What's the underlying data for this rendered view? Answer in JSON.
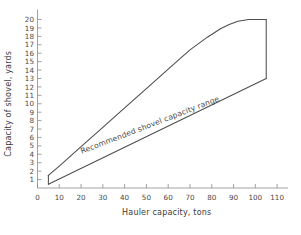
{
  "chart_data": {
    "type": "line",
    "title": "",
    "xlabel": "Hauler capacity, tons",
    "ylabel": "Capacity of shovel, yards",
    "xlim": [
      0,
      115
    ],
    "ylim": [
      0,
      21
    ],
    "grid": false,
    "legend": null,
    "xticks": [
      0,
      10,
      20,
      30,
      40,
      50,
      60,
      70,
      80,
      90,
      100,
      110
    ],
    "xticklabels": [
      "0",
      "10",
      "20",
      "30",
      "40",
      "50",
      "60",
      "70",
      "80",
      "90",
      "100",
      "110"
    ],
    "yticks": [
      1,
      2,
      3,
      4,
      5,
      6,
      7,
      8,
      9,
      10,
      11,
      12,
      13,
      14,
      15,
      16,
      17,
      18,
      19,
      20
    ],
    "yticklabels": [
      "1",
      "2",
      "3",
      "4",
      "5",
      "6",
      "7",
      "8",
      "9",
      "10",
      "11",
      "12",
      "13",
      "14",
      "15",
      "16",
      "17",
      "18",
      "19",
      "20"
    ],
    "annotations": [
      {
        "text": "Recommended shovel capacity range",
        "x": 52,
        "y": 7.2,
        "rotation": -21
      }
    ],
    "series": [
      {
        "name": "upper-bound",
        "comment": "upper boundary of recommended shovel capacity envelope",
        "x": [
          5,
          10,
          20,
          30,
          40,
          50,
          60,
          70,
          78,
          84,
          88,
          92,
          97,
          105
        ],
        "y": [
          1.5,
          2.6,
          4.9,
          7.2,
          9.5,
          11.8,
          14.1,
          16.4,
          17.9,
          18.9,
          19.4,
          19.8,
          20.0,
          20.0
        ]
      },
      {
        "name": "right-edge",
        "comment": "vertical closing edge at maximum hauler capacity",
        "x": [
          105,
          105
        ],
        "y": [
          20.0,
          13.0
        ]
      },
      {
        "name": "lower-bound",
        "comment": "lower boundary of recommended shovel capacity envelope",
        "x": [
          5,
          105
        ],
        "y": [
          0.45,
          13.0
        ]
      },
      {
        "name": "left-edge",
        "comment": "vertical closing edge at minimum hauler capacity",
        "x": [
          5,
          5
        ],
        "y": [
          1.5,
          0.45
        ]
      }
    ],
    "colors": {
      "curve": "#4d4d4d",
      "axis": "#8a8a8a",
      "text": "#4a4a4a",
      "background": "#ffffff"
    }
  }
}
